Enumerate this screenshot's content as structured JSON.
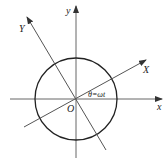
{
  "diagram": {
    "labels": {
      "x_axis": "x",
      "y_axis": "y",
      "X_axis": "X",
      "Y_axis": "Y",
      "origin": "O",
      "angle": "θ=ωt"
    },
    "colors": {
      "line": "#555555",
      "circle": "#222222",
      "text": "#222222"
    }
  }
}
